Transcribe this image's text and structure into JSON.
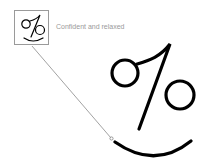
{
  "callout": {
    "label": "Confident and relaxed",
    "thumbnail_icon": "percent-smiley-icon",
    "border_color": "#9a9a9a"
  },
  "figure": {
    "icon": "percent-smiley-icon",
    "stroke_color": "#000000",
    "leader_line_color": "#8a8a8a"
  }
}
